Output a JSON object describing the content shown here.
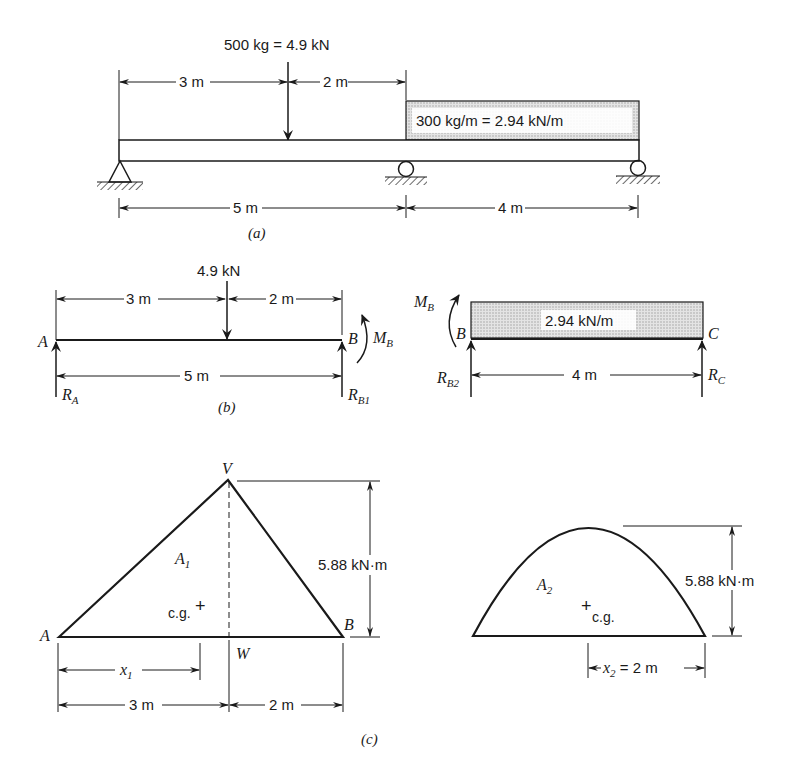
{
  "panel_a": {
    "caption": "(a)",
    "point_load": "500 kg = 4.9 kN",
    "dim_3m": "3 m",
    "dim_2m": "2 m",
    "dist_load": "300 kg/m = 2.94 kN/m",
    "dim_5m": "5 m",
    "dim_4m": "4 m"
  },
  "panel_b": {
    "caption": "(b)",
    "left": {
      "point_load": "4.9 kN",
      "dim_3m": "3 m",
      "dim_2m": "2 m",
      "dim_5m": "5 m",
      "label_A": "A",
      "label_B": "B",
      "moment": "M",
      "moment_sub": "B",
      "reaction_A": "R",
      "reaction_A_sub": "A",
      "reaction_B1": "R",
      "reaction_B1_sub": "B1"
    },
    "right": {
      "moment": "M",
      "moment_sub": "B",
      "label_B": "B",
      "label_C": "C",
      "dist_load": "2.94 kN/m",
      "dim_4m": "4 m",
      "reaction_B2": "R",
      "reaction_B2_sub": "B2",
      "reaction_C": "R",
      "reaction_C_sub": "C"
    }
  },
  "panel_c": {
    "caption": "(c)",
    "triangle": {
      "label_V": "V",
      "label_A": "A",
      "label_B": "B",
      "label_W": "W",
      "area": "A",
      "area_sub": "1",
      "cg": "c.g.",
      "height": "5.88 kN·m",
      "x": "x",
      "x_sub": "1",
      "dim_3m": "3 m",
      "dim_2m": "2 m"
    },
    "parabola": {
      "area": "A",
      "area_sub": "2",
      "cg": "c.g.",
      "height": "5.88 kN·m",
      "x": "x",
      "x_sub": "2",
      "x_value": " = 2 m"
    }
  }
}
